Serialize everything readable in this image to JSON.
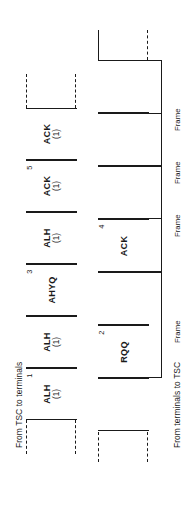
{
  "figure": {
    "type": "timing-sequence-diagram",
    "orientation": "rotated-90-ccw",
    "channels": [
      {
        "id": "downlink",
        "label": "From TSC to terminals",
        "cells": [
          {
            "index": "1",
            "main": "ALH",
            "sub": "(1)"
          },
          {
            "index": "",
            "main": "ALH",
            "sub": "(1)"
          },
          {
            "index": "3",
            "main": "AHYQ",
            "sub": ""
          },
          {
            "index": "",
            "main": "ALH",
            "sub": "(1)"
          },
          {
            "index": "5",
            "main": "ACK",
            "sub": "(1)"
          },
          {
            "index": "",
            "main": "ACK",
            "sub": "(1)"
          }
        ]
      },
      {
        "id": "uplink",
        "label": "From terminals to TSC",
        "cells": [
          {
            "index": "",
            "main": "",
            "sub": ""
          },
          {
            "index": "2",
            "main": "RQQ",
            "sub": ""
          },
          {
            "index": "",
            "main": "",
            "sub": ""
          },
          {
            "index": "4",
            "main": "ACK",
            "sub": ""
          },
          {
            "index": "",
            "main": "",
            "sub": ""
          },
          {
            "index": "",
            "main": "",
            "sub": ""
          },
          {
            "index": "",
            "main": "",
            "sub": ""
          }
        ]
      }
    ],
    "brackets": [
      {
        "label": "Frame"
      },
      {
        "label": "Frame"
      },
      {
        "label": "Frame"
      },
      {
        "label": "Frame"
      }
    ],
    "colors": {
      "ink": "#1a1a1a",
      "background": "#ffffff"
    }
  }
}
